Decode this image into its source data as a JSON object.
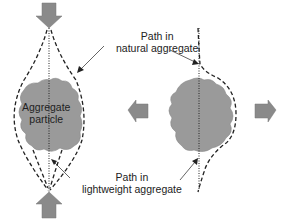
{
  "labels": {
    "natural_line1": "Path in",
    "natural_line2": "natural aggregate",
    "light_line1": "Path in",
    "light_line2": "lightweight aggregate",
    "particle_line1": "Aggregate",
    "particle_line2": "particle"
  },
  "colors": {
    "particle_fill": "#9a9a9a",
    "arrow_fill": "#8a8a8a",
    "line": "#222222"
  },
  "panels": [
    {
      "name": "compression",
      "arrows": [
        "down-top",
        "up-bottom"
      ]
    },
    {
      "name": "tension",
      "arrows": [
        "left",
        "right"
      ]
    }
  ]
}
